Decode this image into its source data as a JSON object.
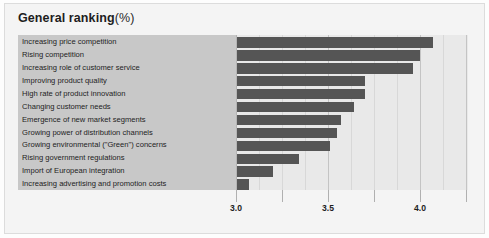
{
  "title": {
    "main": "General ranking",
    "unit": "(%)"
  },
  "chart_data": {
    "type": "bar",
    "orientation": "horizontal",
    "xlabel": "",
    "ylabel": "",
    "xlim": [
      3.0,
      4.25
    ],
    "grid": true,
    "legend": false,
    "tick_labels": [
      "3.0",
      "3.5",
      "4.0"
    ],
    "tick_values": [
      3.0,
      3.5,
      4.0
    ],
    "minor_ticks": [
      3.125,
      3.25,
      3.375,
      3.625,
      3.75,
      3.875,
      4.125
    ],
    "categories": [
      "Increasing price competition",
      "Rising competition",
      "Increasing role of customer service",
      "Improving product quality",
      "High rate of product innovation",
      "Changing customer needs",
      "Emergence of new market segments",
      "Growing power of distribution channels",
      "Growing environmental (\"Green\") concerns",
      "Rising government regulations",
      "Import of European integration",
      "Increasing advertising and promotion costs"
    ],
    "values": [
      4.07,
      4.0,
      3.96,
      3.7,
      3.7,
      3.64,
      3.57,
      3.55,
      3.51,
      3.34,
      3.2,
      3.07
    ]
  },
  "colors": {
    "bar": "#555555",
    "label_panel": "#c8c8c8",
    "plot_background": "#e9e9e9",
    "frame": "#f4f4f4",
    "gridline": "#c4c4c4"
  }
}
